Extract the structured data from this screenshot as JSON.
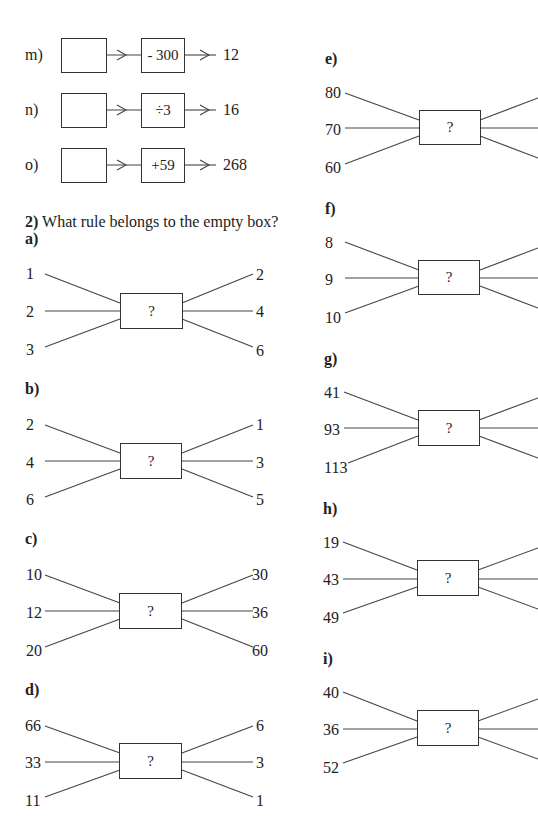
{
  "section1": {
    "items": [
      {
        "label": "m)",
        "input": "",
        "operation": "- 300",
        "output": "12"
      },
      {
        "label": "n)",
        "input": "",
        "operation": "÷3",
        "output": "16"
      },
      {
        "label": "o)",
        "input": "",
        "operation": "+59",
        "output": "268"
      }
    ]
  },
  "section2": {
    "number": "2)",
    "question": "What rule belongs to the empty box?",
    "diagrams": [
      {
        "label": "a)",
        "inputs": [
          "1",
          "2",
          "3"
        ],
        "outputs": [
          "2",
          "4",
          "6"
        ],
        "box": "?"
      },
      {
        "label": "b)",
        "inputs": [
          "2",
          "4",
          "6"
        ],
        "outputs": [
          "1",
          "3",
          "5"
        ],
        "box": "?"
      },
      {
        "label": "c)",
        "inputs": [
          "10",
          "12",
          "20"
        ],
        "outputs": [
          "30",
          "36",
          "60"
        ],
        "box": "?"
      },
      {
        "label": "d)",
        "inputs": [
          "66",
          "33",
          "11"
        ],
        "outputs": [
          "6",
          "3",
          "1"
        ],
        "box": "?"
      },
      {
        "label": "e)",
        "inputs": [
          "80",
          "70",
          "60"
        ],
        "outputs": [],
        "box": "?"
      },
      {
        "label": "f)",
        "inputs": [
          "8",
          "9",
          "10"
        ],
        "outputs": [],
        "box": "?"
      },
      {
        "label": "g)",
        "inputs": [
          "41",
          "93",
          "113"
        ],
        "outputs": [],
        "box": "?"
      },
      {
        "label": "h)",
        "inputs": [
          "19",
          "43",
          "49"
        ],
        "outputs": [],
        "box": "?"
      },
      {
        "label": "i)",
        "inputs": [
          "40",
          "36",
          "52"
        ],
        "outputs": [],
        "box": "?"
      }
    ]
  }
}
